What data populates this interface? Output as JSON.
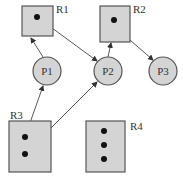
{
  "diagram": {
    "type": "resource-allocation-graph",
    "resources": [
      {
        "id": "R1",
        "label": "R1",
        "instances": 1
      },
      {
        "id": "R2",
        "label": "R2",
        "instances": 1
      },
      {
        "id": "R3",
        "label": "R3",
        "instances": 2
      },
      {
        "id": "R4",
        "label": "R4",
        "instances": 3
      }
    ],
    "processes": [
      {
        "id": "P1",
        "label": "P1"
      },
      {
        "id": "P2",
        "label": "P2"
      },
      {
        "id": "P3",
        "label": "P3"
      }
    ],
    "edges": [
      {
        "from": "P1",
        "to": "R1",
        "kind": "request"
      },
      {
        "from": "R1",
        "to": "P2",
        "kind": "assignment"
      },
      {
        "from": "P2",
        "to": "R2",
        "kind": "request"
      },
      {
        "from": "R2",
        "to": "P3",
        "kind": "assignment"
      },
      {
        "from": "R3",
        "to": "P1",
        "kind": "assignment"
      },
      {
        "from": "R3",
        "to": "P2",
        "kind": "assignment"
      }
    ],
    "colors": {
      "node_fill": "#d4d4d4",
      "node_stroke": "#555555",
      "dot": "#111111",
      "edge": "#444444"
    }
  }
}
